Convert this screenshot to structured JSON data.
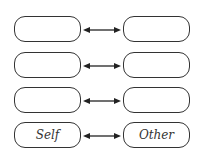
{
  "diagram": {
    "rows": [
      {
        "left": "",
        "right": ""
      },
      {
        "left": "",
        "right": ""
      },
      {
        "left": "",
        "right": ""
      },
      {
        "left": "Self",
        "right": "Other"
      }
    ],
    "connector": "bidirectional-arrow"
  }
}
